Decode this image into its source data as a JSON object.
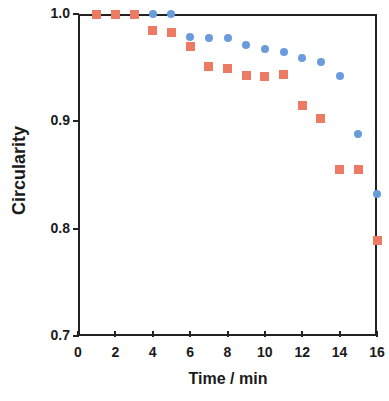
{
  "chart_data": {
    "type": "scatter",
    "title": "",
    "xlabel": "Time / min",
    "ylabel": "Circularity",
    "xlim": [
      0,
      16
    ],
    "ylim": [
      0.7,
      1.0
    ],
    "xticks": [
      0,
      2,
      4,
      6,
      8,
      10,
      12,
      14,
      16
    ],
    "xticklabels": [
      "0",
      "2",
      "4",
      "6",
      "8",
      "10",
      "12",
      "14",
      "16"
    ],
    "yticks": [
      0.7,
      0.8,
      0.9,
      1.0
    ],
    "yticklabels": [
      "0.7",
      "0.8",
      "0.9",
      "1.0"
    ],
    "grid": false,
    "legend": "none",
    "series": [
      {
        "name": "blue-series",
        "marker": "circle",
        "color": "#6A9BDC",
        "x": [
          1,
          2,
          3,
          4,
          5,
          6,
          7,
          8,
          9,
          10,
          11,
          12,
          13,
          14,
          15,
          16
        ],
        "y": [
          1.0,
          1.0,
          1.0,
          1.0,
          1.0,
          0.979,
          0.978,
          0.978,
          0.971,
          0.967,
          0.965,
          0.959,
          0.955,
          0.942,
          0.888,
          0.832
        ]
      },
      {
        "name": "red-series",
        "marker": "square",
        "color": "#ED7B63",
        "x": [
          1,
          2,
          3,
          4,
          5,
          6,
          7,
          8,
          9,
          10,
          11,
          12,
          13,
          14,
          15,
          16
        ],
        "y": [
          1.0,
          1.0,
          1.0,
          0.985,
          0.983,
          0.97,
          0.951,
          0.949,
          0.943,
          0.942,
          0.944,
          0.915,
          0.903,
          0.855,
          0.855,
          0.789
        ]
      }
    ]
  },
  "axes": {
    "y_title": "Circularity",
    "x_title": "Time / min"
  }
}
